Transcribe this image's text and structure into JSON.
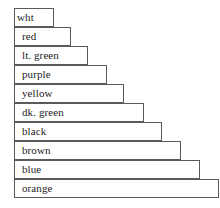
{
  "chart_data": {
    "type": "bar",
    "orientation": "horizontal",
    "title": "",
    "xlabel": "",
    "ylabel": "",
    "grid": false,
    "legend": null,
    "categories": [
      "wht",
      "red",
      "lt. green",
      "purple",
      "yellow",
      "dk. green",
      "black",
      "brown",
      "blue",
      "orange"
    ],
    "values": [
      1,
      2,
      3,
      4,
      5,
      6,
      7,
      8,
      9,
      10
    ],
    "bar_pixel_widths": [
      40,
      57,
      74,
      93,
      110,
      130,
      148,
      167,
      186,
      205
    ],
    "bar_fill_color": "#ffffff",
    "bar_outline_color": "#5a5a5a",
    "background_color": "#ffffff",
    "text_color": "#232323"
  },
  "bars": [
    {
      "label": "wht",
      "width": 40
    },
    {
      "label": "red",
      "width": 57
    },
    {
      "label": "lt. green",
      "width": 74
    },
    {
      "label": "purple",
      "width": 93
    },
    {
      "label": "yellow",
      "width": 110
    },
    {
      "label": "dk. green",
      "width": 130
    },
    {
      "label": "black",
      "width": 148
    },
    {
      "label": "brown",
      "width": 167
    },
    {
      "label": "blue",
      "width": 186
    },
    {
      "label": "orange",
      "width": 205
    }
  ]
}
